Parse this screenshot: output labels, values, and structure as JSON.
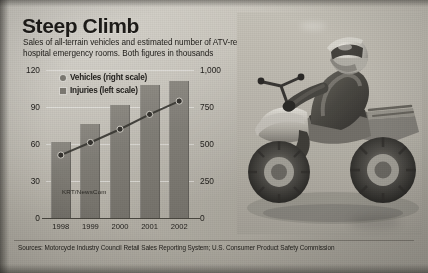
{
  "headline": {
    "title": "Steep Climb",
    "subtitle": "Sales of all-terrain vehicles and estimated number of ATV-related injuries treated in hospital emergency rooms. Both figures in thousands"
  },
  "legend": {
    "vehicles": "Vehicles (right scale)",
    "injuries": "Injuries (left scale)"
  },
  "photo": {
    "credit": "KRT/NewsCom",
    "alt": "Rider in helmet on an all-terrain vehicle"
  },
  "source": "Sources: Motorcycle Industry Council Retail Sales Reporting System; U.S. Consumer Product Safety Commission",
  "axis": {
    "left_ticks": [
      "120",
      "90",
      "60",
      "30",
      "0"
    ],
    "right_ticks": [
      "1,000",
      "750",
      "500",
      "250",
      "0"
    ]
  },
  "colors": {
    "bar": "#7c7972",
    "line": "#3c3a35",
    "ink": "#1d1b18",
    "paper": "#bdb9af"
  },
  "chart_data": {
    "type": "bar",
    "title": "Steep Climb",
    "subtitle": "Sales of all-terrain vehicles and estimated number of ATV-related injuries treated in hospital emergency rooms. Both figures in thousands",
    "categories": [
      "1998",
      "1999",
      "2000",
      "2001",
      "2002"
    ],
    "xlabel": "",
    "grid": true,
    "legend_position": "top-left",
    "series": [
      {
        "name": "Injuries (left scale)",
        "type": "bar",
        "axis": "left",
        "unit": "thousands",
        "values": [
          62,
          76,
          92,
          108,
          111
        ]
      },
      {
        "name": "Vehicles (right scale)",
        "type": "line",
        "axis": "right",
        "unit": "thousands",
        "values": [
          425,
          510,
          600,
          700,
          790
        ]
      }
    ],
    "left_axis": {
      "label": "Injuries (thousands)",
      "ylim": [
        0,
        120
      ],
      "ticks": [
        0,
        30,
        60,
        90,
        120
      ],
      "ticklabels": [
        "0",
        "30",
        "60",
        "90",
        "120"
      ]
    },
    "right_axis": {
      "label": "Vehicles (thousands)",
      "ylim": [
        0,
        1000
      ],
      "ticks": [
        0,
        250,
        500,
        750,
        1000
      ],
      "ticklabels": [
        "0",
        "250",
        "500",
        "750",
        "1,000"
      ]
    },
    "source": "Sources: Motorcycle Industry Council Retail Sales Reporting System; U.S. Consumer Product Safety Commission"
  }
}
